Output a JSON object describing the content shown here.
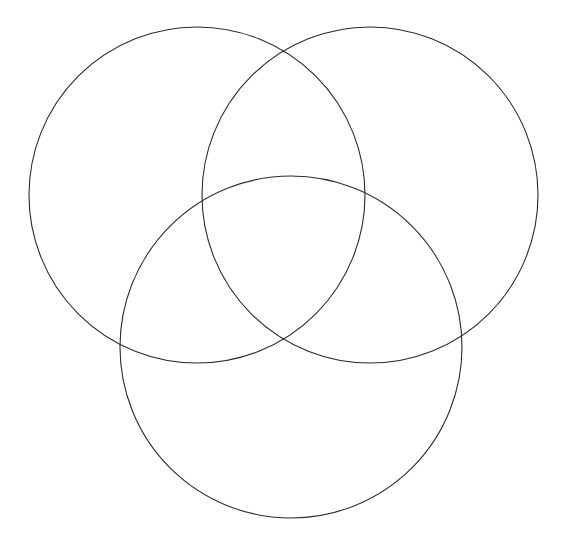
{
  "figure": {
    "kind": "venn-diagram",
    "title": "",
    "background_color": "#ffffff",
    "width": 567,
    "height": 547,
    "set_count": 3,
    "labels_present": false,
    "region_counts_present": false
  },
  "style": {
    "stroke_color": "#2b2b2b",
    "stroke_width": 1.1,
    "fill": "none"
  },
  "chart_data": {
    "type": "diagram",
    "subtype": "venn3",
    "title": "",
    "xlabel": "",
    "ylabel": "",
    "grid": false,
    "legend": "none",
    "xlim": [
      0,
      567
    ],
    "ylim": [
      0,
      547
    ],
    "sets": [
      {
        "name": "set-a-top-left",
        "label": "",
        "cx": 197,
        "cy": 195,
        "r": 168,
        "stroke": "#2b2b2b",
        "fill": "none"
      },
      {
        "name": "set-b-top-right",
        "label": "",
        "cx": 370,
        "cy": 195,
        "r": 168,
        "stroke": "#2b2b2b",
        "fill": "none"
      },
      {
        "name": "set-c-bottom",
        "label": "",
        "cx": 291,
        "cy": 347,
        "r": 171,
        "stroke": "#2b2b2b",
        "fill": "none"
      }
    ],
    "region_labels": [],
    "annotations": []
  }
}
